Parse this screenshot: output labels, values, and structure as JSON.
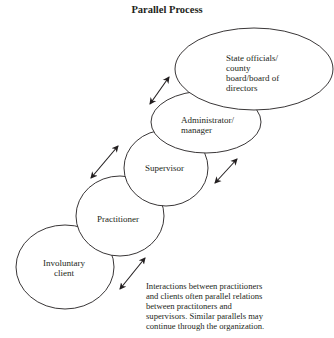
{
  "title": "Parallel Process",
  "nodes": [
    {
      "id": "state",
      "lines": [
        "State officials/",
        "county",
        "board/board of",
        "directors"
      ]
    },
    {
      "id": "administrator",
      "lines": [
        "Administrator/",
        "manager"
      ]
    },
    {
      "id": "supervisor",
      "lines": [
        "Supervisor"
      ]
    },
    {
      "id": "practitioner",
      "lines": [
        "Practitioner"
      ]
    },
    {
      "id": "client",
      "lines": [
        "Involuntary",
        "client"
      ]
    }
  ],
  "caption": {
    "lines": [
      "Interactions between practitioners",
      "and clients often parallel relations",
      "between practitoners and",
      "supervisors. Similar parallels may",
      "continue through the organization."
    ]
  },
  "arrows": [
    {
      "name": "state-administrator",
      "type": "bidirectional"
    },
    {
      "name": "practitioner-supervisor",
      "type": "bidirectional"
    },
    {
      "name": "supervisor-administrator",
      "type": "bidirectional"
    },
    {
      "name": "client-practitioner",
      "type": "bidirectional"
    }
  ]
}
